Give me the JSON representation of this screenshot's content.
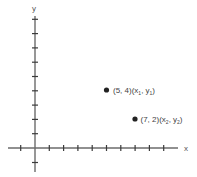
{
  "diagram": {
    "type": "coordinate-plane",
    "axes": {
      "x_label": "x",
      "y_label": "y",
      "x_ticks": [
        -1,
        1,
        2,
        3,
        4,
        5,
        6,
        7,
        8,
        9
      ],
      "y_ticks": [
        -1,
        1,
        2,
        3,
        4,
        5,
        6,
        7,
        8,
        9
      ]
    },
    "points": [
      {
        "x": 5,
        "y": 4,
        "coord_label": "(5, 4)",
        "var_label": "(x",
        "sub1": "1",
        "mid": ", y",
        "sub2": "1",
        "close": ")"
      },
      {
        "x": 7,
        "y": 2,
        "coord_label": "(7, 2)",
        "var_label": "(x",
        "sub1": "2",
        "mid": ", y",
        "sub2": "2",
        "close": ")"
      }
    ],
    "colors": {
      "axis": "#6b6b6b",
      "point": "#222222",
      "text": "#444444"
    }
  }
}
